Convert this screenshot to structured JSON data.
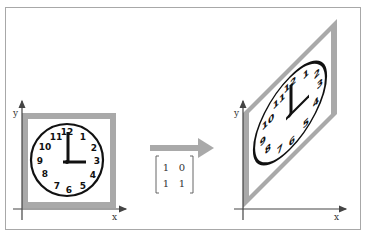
{
  "figure": {
    "colors": {
      "frame": "#a8a8a8",
      "border_gray": "#a9a9a9",
      "axis": "#444444",
      "clock": "#111111",
      "arrow": "#a9a9a9"
    }
  },
  "left_panel": {
    "x_label": "x",
    "y_label": "y",
    "clock_numbers": [
      "12",
      "1",
      "2",
      "3",
      "4",
      "5",
      "6",
      "7",
      "8",
      "9",
      "10",
      "11"
    ],
    "time": "3:00"
  },
  "transform": {
    "arrow_icon": "right-arrow",
    "matrix": {
      "r1c1": "1",
      "r1c2": "0",
      "r2c1": "1",
      "r2c2": "1"
    }
  },
  "right_panel": {
    "x_label": "x",
    "y_label": "y",
    "clock_numbers": [
      "12",
      "1",
      "2",
      "3",
      "4",
      "5",
      "6",
      "7",
      "8",
      "9",
      "10",
      "11"
    ],
    "time": "3:00 (sheared)"
  }
}
